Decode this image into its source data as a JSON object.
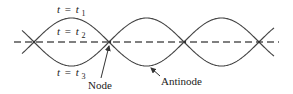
{
  "diagram": {
    "time_labels": [
      {
        "var": "t",
        "eq": "=",
        "sym": "t",
        "sub": "1"
      },
      {
        "var": "t",
        "eq": "=",
        "sym": "t",
        "sub": "2"
      },
      {
        "var": "t",
        "eq": "=",
        "sym": "t",
        "sub": "3"
      }
    ],
    "annotations": {
      "node": "Node",
      "antinode": "Antinode"
    },
    "geometry": {
      "axis_y": 42,
      "amplitude": 24,
      "nodes_x": [
        34,
        110,
        185,
        259
      ],
      "curve_start_x": 22,
      "curve_end_x": 274,
      "axis_start_x": 14,
      "axis_end_x": 279
    },
    "colors": {
      "curve": "#444444",
      "axis": "#555555",
      "text": "#222222"
    }
  }
}
